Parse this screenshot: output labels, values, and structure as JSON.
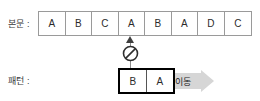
{
  "diagram": {
    "type": "string-pattern-matching-illustration",
    "text_row": {
      "label": "본문 :",
      "cells": [
        "A",
        "B",
        "C",
        "A",
        "B",
        "A",
        "D",
        "C"
      ],
      "cell_count": 8,
      "mismatch_index": 3,
      "mismatch_value": "A"
    },
    "pattern_row": {
      "label": "패턴 :",
      "cells": [
        "B",
        "A"
      ],
      "cell_count": 2,
      "aligned_at_text_index": 3
    },
    "annotations": {
      "mismatch_icon": "prohibition-sign",
      "pointer_icon": "up-arrow",
      "move_label": "이동",
      "move_icon": "right-arrow"
    },
    "colors": {
      "text_cell_border": "#9a9a9a",
      "pattern_box_border": "#000000",
      "pattern_cell_divider": "#555555",
      "connector_line": "#8e8e8e",
      "arrow_fill": "#3f3f3f",
      "mismatch_sign": "#2e2e2e",
      "move_arrow_fill": "#d6d6d6",
      "label_text": "#3a3a3a",
      "cell_text": "#2b2b2b",
      "background": "#ffffff"
    }
  }
}
